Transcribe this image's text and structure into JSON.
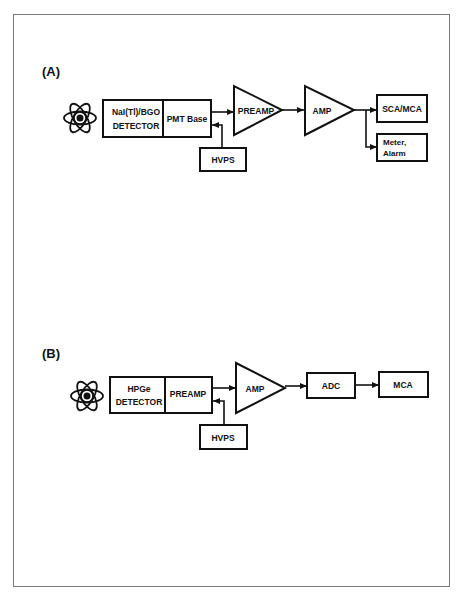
{
  "diagram_a": {
    "label": "(A)",
    "detector_line1": "NaI(Tl)/BGO",
    "detector_line2": "DETECTOR",
    "pmt_base": "PMT Base",
    "preamp": "PREAMP",
    "amp": "AMP",
    "sca_mca": "SCA/MCA",
    "meter_line1": "Meter,",
    "meter_line2": "Alarm",
    "hvps": "HVPS",
    "source_icon": "atom-icon"
  },
  "diagram_b": {
    "label": "(B)",
    "detector_line1": "HPGe",
    "detector_line2": "DETECTOR",
    "preamp": "PREAMP",
    "amp": "AMP",
    "adc": "ADC",
    "mca": "MCA",
    "hvps": "HVPS",
    "source_icon": "atom-icon"
  },
  "colors": {
    "stroke": "#111111",
    "frame": "#7a7a7a",
    "background": "#ffffff"
  }
}
